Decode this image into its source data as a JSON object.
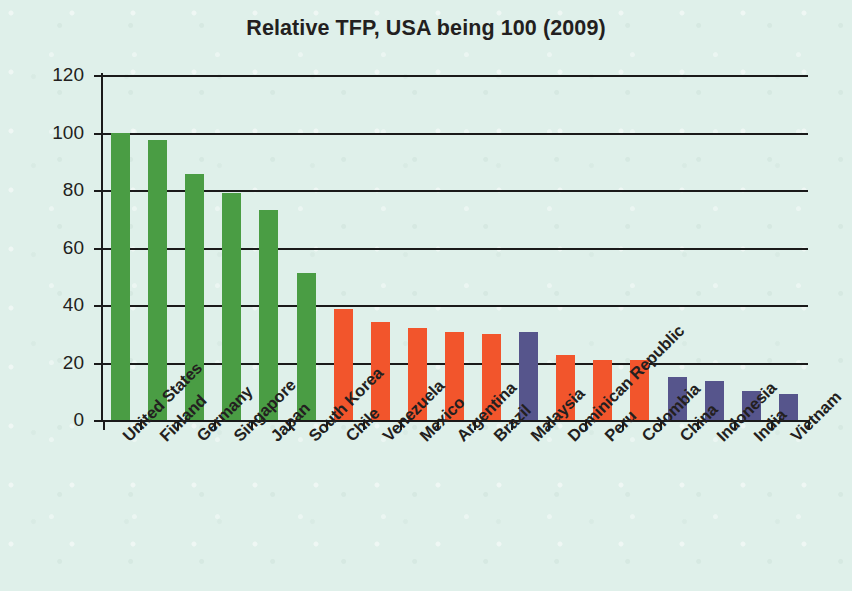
{
  "chart_data": {
    "type": "bar",
    "title": "Relative TFP, USA being 100 (2009)",
    "xlabel": "",
    "ylabel": "",
    "ylim": [
      0,
      120
    ],
    "yticks": [
      0,
      20,
      40,
      60,
      80,
      100,
      120
    ],
    "grid": true,
    "legend": "none",
    "categories": [
      "United States",
      "Finland",
      "Germany",
      "Singapore",
      "Japan",
      "South Korea",
      "Chile",
      "Venezuela",
      "Mexico",
      "Argentina",
      "Brazil",
      "Malaysia",
      "Dominican Republic",
      "Peru",
      "Colombia",
      "China",
      "Indonesia",
      "India",
      "Vietnam"
    ],
    "values": [
      100,
      97.5,
      85.5,
      79,
      73,
      51,
      38.5,
      34,
      32,
      30.5,
      30,
      30.5,
      22.5,
      21,
      21,
      15,
      13.5,
      10,
      9
    ],
    "bar_colors": [
      "#4a9d44",
      "#4a9d44",
      "#4a9d44",
      "#4a9d44",
      "#4a9d44",
      "#4a9d44",
      "#f2552c",
      "#f2552c",
      "#f2552c",
      "#f2552c",
      "#f2552c",
      "#56558c",
      "#f2552c",
      "#f2552c",
      "#f2552c",
      "#56558c",
      "#56558c",
      "#56558c",
      "#56558c"
    ]
  },
  "palette": {
    "green": "#4a9d44",
    "orange": "#f2552c",
    "purple": "#56558c",
    "background": "#dff0ea",
    "axis": "#1a1a1a",
    "text": "#231f20"
  }
}
